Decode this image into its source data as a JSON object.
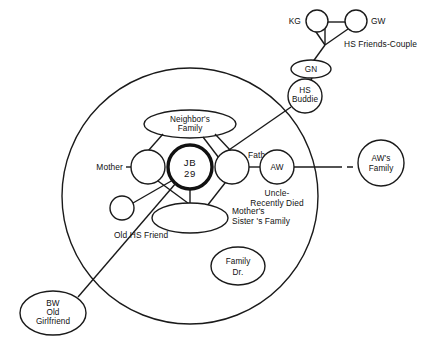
{
  "diagram": {
    "type": "ecomap",
    "title": "",
    "household_boundary": {
      "name": "household-circle",
      "cx": 190,
      "cy": 196,
      "r": 128
    },
    "center_person": {
      "name": "JB",
      "line1": "JB",
      "line2": "29",
      "emphasis": "bold-outline"
    },
    "nodes": [
      {
        "id": "kg",
        "label": "KG",
        "label_position": "left-outside",
        "shape": "circle"
      },
      {
        "id": "gw",
        "label": "GW",
        "label_position": "right-outside",
        "shape": "circle"
      },
      {
        "id": "gn",
        "label": "GN",
        "label_position": "inside",
        "shape": "ellipse"
      },
      {
        "id": "hs_buddie",
        "label": "HS\nBuddie",
        "label_position": "inside",
        "shape": "circle"
      },
      {
        "id": "neighbors",
        "label": "Neighbor's\nFamily",
        "label_position": "inside",
        "shape": "ellipse"
      },
      {
        "id": "mother",
        "label": "Mother",
        "label_position": "left-outside",
        "shape": "circle"
      },
      {
        "id": "jb",
        "label": "JB\n29",
        "label_position": "inside",
        "shape": "circle-bold"
      },
      {
        "id": "father",
        "label": "Father",
        "label_position": "right-outside",
        "shape": "circle"
      },
      {
        "id": "aw",
        "label": "AW",
        "label_position": "inside",
        "shape": "circle"
      },
      {
        "id": "aw_family",
        "label": "AW's\nFamily",
        "label_position": "inside",
        "shape": "circle"
      },
      {
        "id": "msf",
        "label": "Mother's\nSister's Family",
        "label_position": "right-outside",
        "shape": "ellipse"
      },
      {
        "id": "old_hs",
        "label": "Old HS Friend",
        "label_position": "below-outside",
        "shape": "circle"
      },
      {
        "id": "family_dr",
        "label": "Family\nDr.",
        "label_position": "inside",
        "shape": "ellipse"
      },
      {
        "id": "bw",
        "label": "BW\nOld\nGirlfriend",
        "label_position": "inside",
        "shape": "ellipse"
      }
    ],
    "labels": {
      "kg": "KG",
      "gw": "GW",
      "hs_friends_couple": "HS Friends-Couple",
      "gn": "GN",
      "hs_buddie_l1": "HS",
      "hs_buddie_l2": "Buddie",
      "neighbors_l1": "Neighbor's",
      "neighbors_l2": "Family",
      "mother": "Mother",
      "jb_l1": "JB",
      "jb_l2": "29",
      "father": "Father",
      "aw": "AW",
      "uncle_l1": "Uncle-",
      "uncle_l2": "Recently Died",
      "aw_family_l1": "AW's",
      "aw_family_l2": "Family",
      "msf_l1": "Mother's",
      "msf_l2": "Sister 's Family",
      "old_hs_friend": "Old HS Friend",
      "family_dr_l1": "Family",
      "family_dr_l2": "Dr.",
      "bw_l1": "BW",
      "bw_l2": "Old",
      "bw_l3": "Girlfriend"
    },
    "edges": [
      {
        "from": "kg",
        "to": "gw",
        "style": "solid"
      },
      {
        "from": "kg",
        "to": "apex",
        "style": "solid"
      },
      {
        "from": "gw",
        "to": "apex",
        "style": "solid"
      },
      {
        "from": "apex",
        "to": "gn",
        "style": "solid"
      },
      {
        "from": "gn",
        "to": "hs_buddie",
        "style": "solid"
      },
      {
        "from": "hs_buddie",
        "to": "father",
        "style": "solid"
      },
      {
        "from": "neighbors",
        "to": "mother",
        "style": "solid"
      },
      {
        "from": "neighbors",
        "to": "father",
        "style": "solid"
      },
      {
        "from": "neighbors",
        "to": "jb",
        "style": "solid"
      },
      {
        "from": "jb",
        "to": "msf",
        "style": "solid"
      },
      {
        "from": "father",
        "to": "msf",
        "style": "solid"
      },
      {
        "from": "mother",
        "to": "msf",
        "style": "solid"
      },
      {
        "from": "father",
        "to": "aw",
        "style": "solid"
      },
      {
        "from": "aw",
        "to": "aw_family",
        "style": "solid-then-dashed"
      },
      {
        "from": "jb",
        "to": "old_hs",
        "style": "solid"
      },
      {
        "from": "jb",
        "to": "bw",
        "style": "solid"
      }
    ],
    "colors": {
      "ink": "#1a1a1a",
      "paper": "#ffffff"
    }
  }
}
